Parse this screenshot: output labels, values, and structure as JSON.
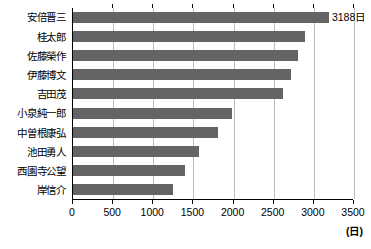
{
  "chart_data": {
    "type": "bar",
    "orientation": "horizontal",
    "title": "",
    "subtitle": "",
    "xlabel": "(日)",
    "ylabel": "",
    "xlim": [
      0,
      3500
    ],
    "xticks": [
      0,
      500,
      1000,
      1500,
      2000,
      2500,
      3000,
      3500
    ],
    "xtick_labels": [
      "0",
      "500",
      "1000",
      "1500",
      "2000",
      "2500",
      "3000",
      "3500"
    ],
    "grid": true,
    "legend": false,
    "bar_color": "#646464",
    "categories": [
      "安倍晋三",
      "桂太郎",
      "佐藤榮作",
      "伊藤博文",
      "吉田茂",
      "小泉純一郎",
      "中曽根康弘",
      "池田勇人",
      "西園寺公望",
      "岸信介"
    ],
    "values": [
      3188,
      2886,
      2798,
      2720,
      2616,
      1980,
      1806,
      1575,
      1400,
      1241
    ],
    "data_labels": [
      "3188日",
      "",
      "",
      "",
      "",
      "",
      "",
      "",
      "",
      ""
    ],
    "annotations": [
      "3188日"
    ]
  }
}
